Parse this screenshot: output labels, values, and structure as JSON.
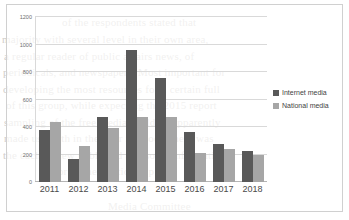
{
  "chart_data": {
    "type": "bar",
    "title": "",
    "xlabel": "",
    "ylabel": "",
    "categories": [
      "2011",
      "2012",
      "2013",
      "2014",
      "2015",
      "2016",
      "2017",
      "2018"
    ],
    "series": [
      {
        "name": "Internet media",
        "color": "#595959",
        "values": [
          375,
          165,
          475,
          960,
          755,
          365,
          280,
          225
        ]
      },
      {
        "name": "National media",
        "color": "#a6a6a6",
        "values": [
          435,
          265,
          395,
          475,
          475,
          210,
          240,
          195
        ]
      }
    ],
    "ylim": [
      0,
      1200
    ],
    "ytick_labels": [
      "1200",
      "1000",
      "800",
      "600",
      "400",
      "200",
      "0"
    ],
    "ytick_values": [
      1200,
      1000,
      800,
      600,
      400,
      200,
      0
    ],
    "grid": true,
    "legend_position": "right"
  },
  "legend": {
    "items": [
      {
        "label": "Internet media",
        "swatch": "legend-swatch-internet-media"
      },
      {
        "label": "National media",
        "swatch": "legend-swatch-national-media"
      }
    ]
  },
  "background_bleed": [
    {
      "text": "of the respondents stated that",
      "x": 62,
      "y": 16
    },
    {
      "text": "majority  with  several   level  in  their  own  area,",
      "x": 2,
      "y": 33
    },
    {
      "text": "a   regular   reader   of   public   affairs   news,   of",
      "x": 4,
      "y": 50
    },
    {
      "text": "periodicals,  and  newspapers.  Most  important  for",
      "x": 3,
      "y": 66
    },
    {
      "text": "developing  the  most  resources  for  a  certain  full",
      "x": 3,
      "y": 83
    },
    {
      "text": "of  this  group,  while  expecting  the  2015  report",
      "x": 6,
      "y": 99
    },
    {
      "text": "sampling  of  the  free  media  could  be  apparently",
      "x": 4,
      "y": 116
    },
    {
      "text": "made  use  with  in  the  later  methods,   there  was",
      "x": 4,
      "y": 132
    },
    {
      "text": "the  each  review  published  and  some  information",
      "x": 3,
      "y": 149
    },
    {
      "text": "sector  as  the  relationship",
      "x": 40,
      "y": 165
    },
    {
      "text": "Media Committee",
      "x": 108,
      "y": 200
    }
  ]
}
